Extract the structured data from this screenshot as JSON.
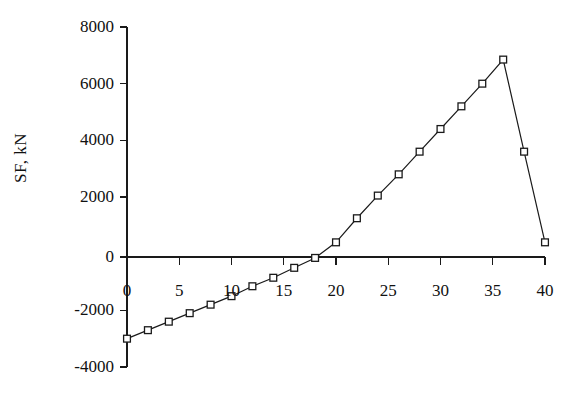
{
  "chart_data": {
    "type": "line",
    "title": "",
    "subtitle": "",
    "xlabel": "",
    "ylabel": "SF, kN",
    "xlim": [
      0,
      40
    ],
    "ylim": [
      -4000,
      8000
    ],
    "xticks": [
      0,
      5,
      10,
      15,
      20,
      25,
      30,
      35,
      40
    ],
    "xtick_labels": [
      "0",
      "5",
      "10",
      "15",
      "20",
      "25",
      "30",
      "35",
      "40"
    ],
    "yticks": [
      -4000,
      -2000,
      0,
      2000,
      4000,
      6000,
      8000
    ],
    "ytick_labels": [
      "-4000",
      "-2000",
      "0",
      "2000",
      "4000",
      "6000",
      "8000"
    ],
    "grid": false,
    "legend": false,
    "legend_position": "none",
    "marker": "square-open",
    "line_color": "#1a1a1a",
    "marker_face_color": "#ffffff",
    "marker_edge_color": "#1a1a1a",
    "zero_line": true,
    "series": [
      {
        "name": "SF",
        "x": [
          0,
          2,
          4,
          6,
          8,
          10,
          12,
          14,
          16,
          18,
          20,
          22,
          24,
          26,
          28,
          30,
          32,
          34,
          36,
          38,
          40
        ],
        "values": [
          -3000,
          -2700,
          -2400,
          -2100,
          -1800,
          -1500,
          -1150,
          -850,
          -500,
          -150,
          400,
          1250,
          2050,
          2800,
          3600,
          4400,
          5200,
          6000,
          6850,
          3600,
          400
        ]
      }
    ]
  },
  "axis_title": {
    "y": "SF, kN"
  }
}
